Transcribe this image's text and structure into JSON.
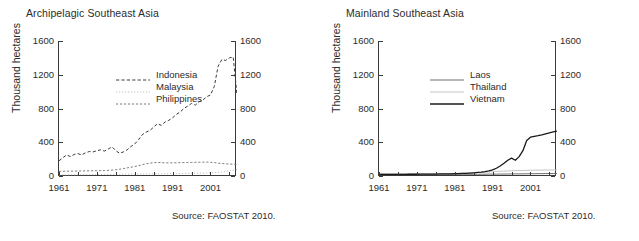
{
  "figure": {
    "panels": [
      {
        "id": "archipelagic",
        "title": "Archipelagic Southeast Asia",
        "ylabel": "Thousand hectares",
        "source": "Source: FAOSTAT 2010."
      },
      {
        "id": "mainland",
        "title": "Mainland Southeast Asia",
        "ylabel": "Thousand hectares",
        "source": "Source: FAOSTAT 2010."
      }
    ]
  },
  "axis": {
    "yticks": [
      "0",
      "400",
      "800",
      "1200",
      "1600"
    ],
    "xticks": [
      "1961",
      "1971",
      "1981",
      "1991",
      "2001"
    ]
  },
  "chart_data": [
    {
      "type": "line",
      "title": "Archipelagic Southeast Asia",
      "xlabel": "",
      "ylabel": "Thousand hectares",
      "xlim": [
        1961,
        2008
      ],
      "ylim": [
        0,
        1600
      ],
      "ytick_values": [
        0,
        400,
        800,
        1200,
        1600
      ],
      "xtick_values": [
        1961,
        1971,
        1981,
        1991,
        2001
      ],
      "grid": false,
      "legend_position": "upper-left-inside",
      "source": "Source: FAOSTAT 2010.",
      "x": [
        1961,
        1962,
        1963,
        1964,
        1965,
        1966,
        1967,
        1968,
        1969,
        1970,
        1971,
        1972,
        1973,
        1974,
        1975,
        1976,
        1977,
        1978,
        1979,
        1980,
        1981,
        1982,
        1983,
        1984,
        1985,
        1986,
        1987,
        1988,
        1989,
        1990,
        1991,
        1992,
        1993,
        1994,
        1995,
        1996,
        1997,
        1998,
        1999,
        2000,
        2001,
        2002,
        2003,
        2004,
        2005,
        2006,
        2007,
        2008
      ],
      "series": [
        {
          "name": "Indonesia",
          "style": "dashed",
          "color": "#3a3a3a",
          "values": [
            180,
            215,
            250,
            230,
            255,
            265,
            250,
            275,
            290,
            285,
            300,
            310,
            295,
            320,
            345,
            300,
            270,
            285,
            310,
            350,
            380,
            430,
            490,
            520,
            540,
            580,
            620,
            600,
            640,
            660,
            690,
            730,
            760,
            800,
            830,
            860,
            840,
            880,
            900,
            940,
            960,
            1060,
            1300,
            1380,
            1370,
            1400,
            1410,
            960
          ]
        },
        {
          "name": "Malaysia",
          "style": "dotted",
          "color": "#b8b8b8",
          "values": [
            12,
            13,
            13,
            14,
            14,
            15,
            15,
            16,
            16,
            17,
            17,
            18,
            18,
            19,
            19,
            20,
            20,
            21,
            21,
            22,
            22,
            23,
            23,
            24,
            24,
            25,
            26,
            26,
            27,
            27,
            28,
            29,
            29,
            30,
            31,
            32,
            33,
            34,
            35,
            36,
            38,
            40,
            43,
            48,
            55,
            62,
            70,
            78
          ]
        },
        {
          "name": "Philippines",
          "style": "dashed-fine",
          "color": "#6e6e6e",
          "values": [
            55,
            56,
            57,
            58,
            58,
            59,
            60,
            60,
            61,
            62,
            63,
            64,
            65,
            67,
            70,
            74,
            80,
            88,
            96,
            104,
            112,
            122,
            134,
            145,
            152,
            158,
            160,
            158,
            156,
            155,
            156,
            157,
            158,
            159,
            160,
            160,
            162,
            163,
            164,
            165,
            162,
            158,
            152,
            148,
            145,
            142,
            140,
            138
          ]
        }
      ]
    },
    {
      "type": "line",
      "title": "Mainland Southeast Asia",
      "xlabel": "",
      "ylabel": "Thousand hectares",
      "xlim": [
        1961,
        2008
      ],
      "ylim": [
        0,
        1600
      ],
      "ytick_values": [
        0,
        400,
        800,
        1200,
        1600
      ],
      "xtick_values": [
        1961,
        1971,
        1981,
        1991,
        2001
      ],
      "grid": false,
      "legend_position": "upper-left-inside",
      "source": "Source: FAOSTAT 2010.",
      "x": [
        1961,
        1962,
        1963,
        1964,
        1965,
        1966,
        1967,
        1968,
        1969,
        1970,
        1971,
        1972,
        1973,
        1974,
        1975,
        1976,
        1977,
        1978,
        1979,
        1980,
        1981,
        1982,
        1983,
        1984,
        1985,
        1986,
        1987,
        1988,
        1989,
        1990,
        1991,
        1992,
        1993,
        1994,
        1995,
        1996,
        1997,
        1998,
        1999,
        2000,
        2001,
        2002,
        2003,
        2004,
        2005,
        2006,
        2007,
        2008
      ],
      "series": [
        {
          "name": "Laos",
          "style": "solid",
          "color": "#6e6e6e",
          "values": [
            20,
            20,
            20,
            20,
            20,
            20,
            20,
            20,
            20,
            20,
            20,
            20,
            20,
            20,
            20,
            20,
            20,
            20,
            20,
            20,
            20,
            20,
            20,
            20,
            20,
            20,
            21,
            21,
            21,
            22,
            22,
            22,
            23,
            23,
            24,
            24,
            25,
            25,
            26,
            26,
            27,
            27,
            28,
            28,
            29,
            29,
            30,
            30
          ]
        },
        {
          "name": "Thailand",
          "style": "solid-light",
          "color": "#c4c4c4",
          "values": [
            24,
            24,
            24,
            24,
            24,
            24,
            24,
            25,
            25,
            25,
            25,
            26,
            26,
            26,
            27,
            27,
            28,
            28,
            29,
            30,
            31,
            32,
            33,
            35,
            37,
            39,
            41,
            43,
            45,
            48,
            50,
            53,
            56,
            58,
            60,
            62,
            64,
            65,
            66,
            67,
            68,
            69,
            70,
            70,
            71,
            71,
            72,
            72
          ]
        },
        {
          "name": "Vietnam",
          "style": "solid-dark",
          "color": "#1a1a1a",
          "values": [
            20,
            20,
            20,
            20,
            20,
            20,
            20,
            20,
            21,
            21,
            21,
            22,
            22,
            22,
            23,
            23,
            24,
            24,
            25,
            26,
            27,
            28,
            30,
            32,
            35,
            38,
            42,
            46,
            52,
            60,
            72,
            92,
            118,
            150,
            186,
            212,
            186,
            230,
            300,
            420,
            460,
            470,
            478,
            488,
            500,
            512,
            522,
            532
          ]
        }
      ]
    }
  ]
}
